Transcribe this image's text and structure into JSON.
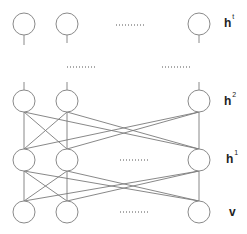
{
  "diagram": {
    "type": "deep-belief-network",
    "layers": [
      {
        "id": "ht",
        "label": "h",
        "sup": "t",
        "y": 24
      },
      {
        "id": "h2",
        "label": "h",
        "sup": "2",
        "y": 101
      },
      {
        "id": "h1",
        "label": "h",
        "sup": "1",
        "y": 160
      },
      {
        "id": "v",
        "label": "v",
        "sup": "",
        "y": 212
      }
    ],
    "columns_x": [
      24,
      67,
      199
    ],
    "node_radius": 11,
    "ellipsis": "..........",
    "colors": {
      "stroke": "#8a8a8a",
      "edge": "#7a7a7a",
      "text": "#222222"
    }
  },
  "labels": {
    "ht": "h",
    "ht_sup": "t",
    "h2": "h",
    "h2_sup": "2",
    "h1": "h",
    "h1_sup": "1",
    "v": "v"
  }
}
